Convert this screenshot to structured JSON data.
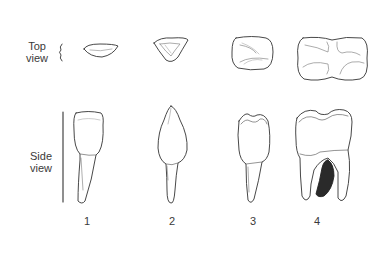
{
  "diagram": {
    "row_labels": {
      "top": [
        "Top",
        "view"
      ],
      "side": [
        "Side",
        "view"
      ]
    },
    "teeth": [
      {
        "number": "1",
        "type": "incisor"
      },
      {
        "number": "2",
        "type": "canine"
      },
      {
        "number": "3",
        "type": "premolar"
      },
      {
        "number": "4",
        "type": "molar"
      }
    ],
    "colors": {
      "line": "#333333",
      "shading": "#888888",
      "root_cavity": "#2a2a2a",
      "background": "#ffffff"
    }
  }
}
